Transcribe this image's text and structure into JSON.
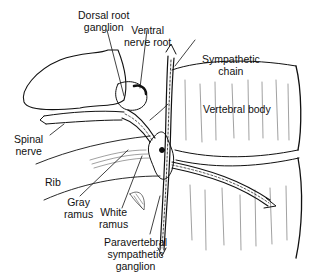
{
  "diagram": {
    "labels": {
      "dorsal_root_ganglion": {
        "line1": "Dorsal root",
        "line2": "ganglion"
      },
      "ventral_nerve_root": {
        "line1": "Ventral",
        "line2": "nerve root"
      },
      "sympathetic_chain": {
        "line1": "Sympathetic",
        "line2": "chain"
      },
      "vertebral_body": {
        "line1": "Vertebral body"
      },
      "spinal_nerve": {
        "line1": "Spinal",
        "line2": "nerve"
      },
      "rib": {
        "line1": "Rib"
      },
      "gray_ramus": {
        "line1": "Gray",
        "line2": "ramus"
      },
      "white_ramus": {
        "line1": "White",
        "line2": "ramus"
      },
      "paravertebral_ganglion": {
        "line1": "Paravertebral",
        "line2": "sympathetic",
        "line3": "ganglion"
      }
    },
    "colors": {
      "ink": "#111111",
      "background": "#ffffff"
    }
  }
}
